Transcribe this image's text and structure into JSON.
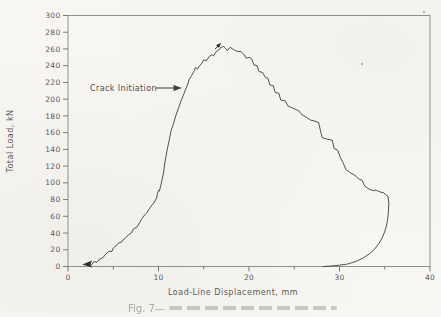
{
  "figure": {
    "kind": "scanned load-displacement test record",
    "caption_fragment": "Fig. 7—"
  },
  "colors": {
    "paper": "#f7f6f2",
    "frame": "#8f8f8f",
    "tick": "#7a7a7a",
    "ink": "#5a5a5a",
    "curve": "#3d3d3d",
    "marker": "#2e2e2e"
  },
  "chart_data": {
    "type": "line",
    "title": "",
    "xlabel": "Load-Line Displacement, mm",
    "ylabel": "Total Load, kN",
    "xlim": [
      0,
      40
    ],
    "ylim": [
      0,
      300
    ],
    "x_major_ticks": [
      0,
      10,
      20,
      30,
      40
    ],
    "x_minor_ticks": [
      5,
      15,
      25,
      35
    ],
    "y_ticks": [
      0,
      20,
      40,
      60,
      80,
      100,
      120,
      140,
      160,
      180,
      200,
      220,
      240,
      260,
      280,
      300
    ],
    "grid": false,
    "legend": null,
    "series": [
      {
        "name": "load-displacement-curve",
        "points": [
          [
            2.2,
            1
          ],
          [
            2.45,
            4
          ],
          [
            2.6,
            2
          ],
          [
            2.9,
            6
          ],
          [
            3.2,
            5
          ],
          [
            3.5,
            9
          ],
          [
            3.8,
            10
          ],
          [
            4.2,
            15
          ],
          [
            4.5,
            18
          ],
          [
            4.85,
            18
          ],
          [
            5.0,
            22
          ],
          [
            5.3,
            25
          ],
          [
            5.6,
            28
          ],
          [
            5.9,
            29
          ],
          [
            6.2,
            33
          ],
          [
            6.45,
            35
          ],
          [
            6.7,
            38
          ],
          [
            7.0,
            40
          ],
          [
            7.25,
            45
          ],
          [
            7.6,
            47
          ],
          [
            7.9,
            52
          ],
          [
            8.1,
            56
          ],
          [
            8.4,
            61
          ],
          [
            8.7,
            64
          ],
          [
            9.0,
            69
          ],
          [
            9.3,
            74
          ],
          [
            9.5,
            76
          ],
          [
            9.8,
            82
          ],
          [
            9.9,
            88
          ],
          [
            10.0,
            91
          ],
          [
            10.1,
            90
          ],
          [
            10.25,
            97
          ],
          [
            10.4,
            104
          ],
          [
            10.55,
            112
          ],
          [
            10.7,
            124
          ],
          [
            10.85,
            133
          ],
          [
            11.0,
            142
          ],
          [
            11.2,
            152
          ],
          [
            11.4,
            163
          ],
          [
            11.65,
            170
          ],
          [
            11.9,
            180
          ],
          [
            12.2,
            189
          ],
          [
            12.5,
            198
          ],
          [
            12.8,
            206
          ],
          [
            13.0,
            212
          ],
          [
            13.2,
            217
          ],
          [
            13.4,
            224
          ],
          [
            13.65,
            228
          ],
          [
            13.9,
            233
          ],
          [
            14.1,
            238
          ],
          [
            14.3,
            236
          ],
          [
            14.55,
            240
          ],
          [
            14.8,
            243
          ],
          [
            15.0,
            247
          ],
          [
            15.3,
            246
          ],
          [
            15.6,
            251
          ],
          [
            15.9,
            253
          ],
          [
            16.1,
            252
          ],
          [
            16.4,
            257
          ],
          [
            16.7,
            259
          ],
          [
            16.9,
            262
          ],
          [
            17.2,
            263
          ],
          [
            17.4,
            261
          ],
          [
            17.6,
            258
          ],
          [
            17.9,
            262
          ],
          [
            18.2,
            260
          ],
          [
            18.5,
            258
          ],
          [
            18.8,
            257
          ],
          [
            19.1,
            257
          ],
          [
            19.4,
            254
          ],
          [
            19.7,
            249
          ],
          [
            20.0,
            250
          ],
          [
            20.3,
            248
          ],
          [
            20.55,
            241
          ],
          [
            20.9,
            240
          ],
          [
            21.1,
            233
          ],
          [
            21.5,
            232
          ],
          [
            21.8,
            226
          ],
          [
            22.1,
            225
          ],
          [
            22.3,
            217
          ],
          [
            22.7,
            216
          ],
          [
            22.9,
            208
          ],
          [
            23.3,
            207
          ],
          [
            23.5,
            199
          ],
          [
            24.0,
            198
          ],
          [
            24.3,
            192
          ],
          [
            24.7,
            190
          ],
          [
            25.1,
            188
          ],
          [
            25.5,
            186
          ],
          [
            25.9,
            181
          ],
          [
            26.4,
            178
          ],
          [
            26.8,
            175
          ],
          [
            27.2,
            174
          ],
          [
            27.7,
            172
          ],
          [
            27.9,
            162
          ],
          [
            28.1,
            154
          ],
          [
            28.7,
            152
          ],
          [
            29.2,
            151
          ],
          [
            29.4,
            141
          ],
          [
            29.8,
            139
          ],
          [
            30.1,
            130
          ],
          [
            30.4,
            124
          ],
          [
            30.7,
            116
          ],
          [
            31.2,
            112
          ],
          [
            31.7,
            109
          ],
          [
            32.1,
            105
          ],
          [
            32.5,
            103
          ],
          [
            32.8,
            96
          ],
          [
            33.2,
            93
          ],
          [
            33.6,
            91
          ],
          [
            34.1,
            91
          ],
          [
            34.5,
            89
          ],
          [
            34.9,
            88
          ],
          [
            35.2,
            85
          ],
          [
            35.35,
            84
          ],
          [
            35.45,
            76
          ],
          [
            35.4,
            65
          ],
          [
            35.3,
            55
          ],
          [
            35.1,
            45
          ],
          [
            34.8,
            36
          ],
          [
            34.4,
            28
          ],
          [
            33.9,
            21
          ],
          [
            33.3,
            15
          ],
          [
            32.6,
            10
          ],
          [
            31.8,
            6
          ],
          [
            30.9,
            3
          ],
          [
            30.0,
            1.5
          ],
          [
            29.0,
            0.5
          ],
          [
            28.2,
            0
          ]
        ]
      }
    ],
    "annotations": [
      {
        "text": "Crack Initiation",
        "text_x_mm": 2.45,
        "text_y_kn": 210,
        "arrow_from_mm": 9.8,
        "arrow_to_mm": 12.7,
        "arrow_y_kn": 213
      }
    ],
    "markers": [
      {
        "type": "solid-left-arrowhead",
        "x": 2.35,
        "y": 3
      },
      {
        "type": "small-up-right-arrowhead",
        "x": 16.8,
        "y": 266
      }
    ],
    "scan_artifacts": [
      {
        "x_px": 362,
        "y_px": 64
      },
      {
        "x_px": 424,
        "y_px": 12
      }
    ]
  }
}
